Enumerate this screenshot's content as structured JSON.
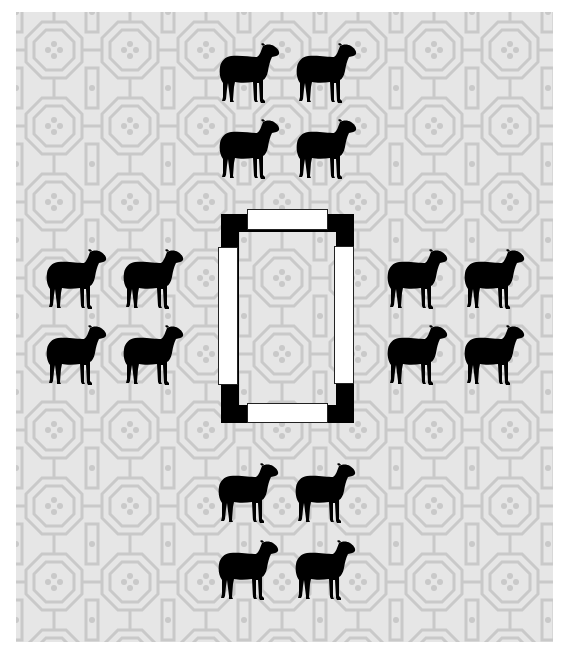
{
  "scene": {
    "description": "Four groups of four black sheep silhouettes arranged around a central rectangular enclosure on a patterned light-gray background",
    "colors": {
      "background_base": "#e6e6e6",
      "background_lines": "#c9c9c9",
      "sheep": "#000000",
      "frame": "#000000",
      "bar_fill": "#ffffff",
      "bar_stroke": "#222222"
    },
    "groups": [
      {
        "name": "top",
        "count": 4,
        "sheep": [
          {
            "x": 203,
            "y": 31
          },
          {
            "x": 280,
            "y": 31
          },
          {
            "x": 203,
            "y": 107
          },
          {
            "x": 280,
            "y": 107
          }
        ]
      },
      {
        "name": "left",
        "count": 4,
        "sheep": [
          {
            "x": 30,
            "y": 237
          },
          {
            "x": 107,
            "y": 237
          },
          {
            "x": 30,
            "y": 313
          },
          {
            "x": 107,
            "y": 313
          }
        ]
      },
      {
        "name": "right",
        "count": 4,
        "sheep": [
          {
            "x": 371,
            "y": 237
          },
          {
            "x": 448,
            "y": 237
          },
          {
            "x": 371,
            "y": 313
          },
          {
            "x": 448,
            "y": 313
          }
        ]
      },
      {
        "name": "bottom",
        "count": 4,
        "sheep": [
          {
            "x": 202,
            "y": 451
          },
          {
            "x": 279,
            "y": 451
          },
          {
            "x": 202,
            "y": 528
          },
          {
            "x": 279,
            "y": 528
          }
        ]
      }
    ],
    "enclosure": {
      "frame": {
        "x": 205,
        "y": 202,
        "w": 133,
        "h": 209,
        "thickness": 18
      },
      "bars": [
        {
          "side": "top",
          "x": 231,
          "y": 197,
          "w": 81,
          "h": 21
        },
        {
          "side": "left",
          "x": 202,
          "y": 235,
          "w": 20,
          "h": 138
        },
        {
          "side": "right",
          "x": 318,
          "y": 234,
          "w": 20,
          "h": 138
        },
        {
          "side": "bottom",
          "x": 231,
          "y": 391,
          "w": 81,
          "h": 20
        }
      ]
    },
    "total_sheep": 16
  }
}
